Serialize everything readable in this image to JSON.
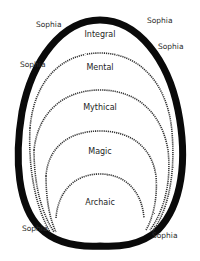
{
  "diagram": {
    "type": "nested-structures-of-consciousness",
    "boundary_label": "Sophia",
    "stages": [
      {
        "id": "integral",
        "label": "Integral"
      },
      {
        "id": "mental",
        "label": "Mental"
      },
      {
        "id": "mythical",
        "label": "Mythical"
      },
      {
        "id": "magic",
        "label": "Magic"
      },
      {
        "id": "archaic",
        "label": "Archaic"
      }
    ],
    "sophia_labels": [
      {
        "id": "top-left",
        "label": "Sophia"
      },
      {
        "id": "top-right",
        "label": "Sophia"
      },
      {
        "id": "upper-right",
        "label": "Sophia"
      },
      {
        "id": "upper-left",
        "label": "Sophia"
      },
      {
        "id": "bottom-left",
        "label": "Sophia"
      },
      {
        "id": "bottom-right",
        "label": "Sophia"
      }
    ],
    "colors": {
      "outline": "#0a0a0a",
      "dotted": "#333333",
      "text": "#222222"
    }
  }
}
